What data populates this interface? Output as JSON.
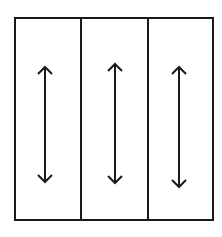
{
  "diagram": {
    "stroke_color": "#1a1a1a",
    "background_color": "#ffffff",
    "frame": {
      "x": 15,
      "y": 18,
      "width": 198,
      "height": 202
    },
    "dividers_x": [
      81,
      148
    ],
    "panels": [
      {
        "index": 1,
        "arrow": {
          "x": 45,
          "y1": 67,
          "y2": 182,
          "type": "double-headed-vertical"
        }
      },
      {
        "index": 2,
        "arrow": {
          "x": 115,
          "y1": 64,
          "y2": 183,
          "type": "double-headed-vertical"
        }
      },
      {
        "index": 3,
        "arrow": {
          "x": 179,
          "y1": 67,
          "y2": 187,
          "type": "double-headed-vertical"
        }
      }
    ]
  }
}
